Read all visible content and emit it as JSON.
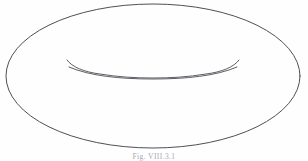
{
  "figure": {
    "caption": "Fig. VIII.3.1",
    "colors": {
      "background": "#fefefe",
      "stroke": "#4a4a52",
      "caption": "#8e8e96"
    },
    "geometry": {
      "outer_ellipse": {
        "center_x": 153,
        "center_y": 76,
        "radius_x": 147,
        "radius_y": 72
      },
      "inner_hole_lower": {
        "center_x": 153,
        "center_y": 66,
        "radius_x": 84,
        "radius_y": 7
      },
      "inner_hole_upper": {
        "left_tip_x": 68,
        "right_tip_x": 238,
        "tip_y": 60,
        "bottom_y": 73
      }
    },
    "labels": {
      "shape_name": "torus",
      "alt": "Outline drawing of a torus shown in perspective with its central hole"
    }
  }
}
